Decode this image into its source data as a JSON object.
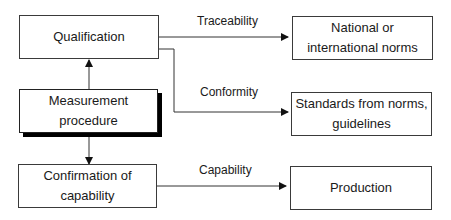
{
  "diagram": {
    "nodes": {
      "qualification": "Qualification",
      "measurement": "Measurement\nprocedure",
      "confirmation": "Confirmation of\ncapability",
      "national": "National or\ninternational norms",
      "standards": "Standards from norms,\nguidelines",
      "production": "Production"
    },
    "edges": {
      "traceability": "Traceability",
      "conformity": "Conformity",
      "capability": "Capability"
    }
  }
}
